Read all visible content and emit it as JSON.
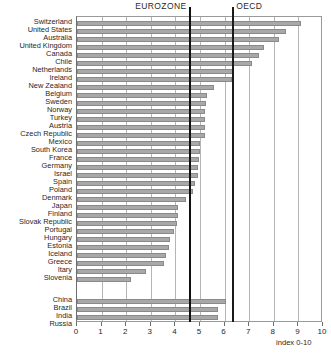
{
  "chart_data": {
    "type": "bar",
    "orientation": "horizontal",
    "title": "",
    "xlabel": "index 0-10",
    "ylabel": "",
    "xlim": [
      0,
      10
    ],
    "xticks": [
      0,
      1,
      2,
      3,
      4,
      5,
      6,
      7,
      8,
      9,
      10
    ],
    "grid": true,
    "legend_position": "none",
    "reference_lines": [
      {
        "label": "EUROZONE",
        "value": 4.6
      },
      {
        "label": "OECD",
        "value": 6.35
      }
    ],
    "groups": [
      {
        "name": "OECD countries",
        "categories": [
          "Switzerland",
          "United States",
          "Australia",
          "United Kingdom",
          "Canada",
          "Chile",
          "Netherlands",
          "Ireland",
          "New Zealand",
          "Belgium",
          "Sweden",
          "Norway",
          "Turkey",
          "Austria",
          "Czech Republic",
          "Mexico",
          "South Korea",
          "France",
          "Germany",
          "Israel",
          "Spain",
          "Poland",
          "Denmark",
          "Japan",
          "Finland",
          "Slovak Republic",
          "Portugal",
          "Hungary",
          "Estonia",
          "Iceland",
          "Greece",
          "Itary",
          "Slovenia"
        ],
        "values": [
          9.1,
          8.5,
          8.2,
          7.6,
          7.4,
          7.1,
          6.35,
          6.3,
          5.55,
          5.3,
          5.25,
          5.2,
          5.2,
          5.2,
          5.2,
          5.0,
          5.0,
          4.95,
          4.9,
          4.9,
          4.8,
          4.7,
          4.45,
          4.1,
          4.1,
          4.05,
          3.95,
          3.8,
          3.75,
          3.6,
          3.55,
          2.8,
          2.2
        ]
      },
      {
        "name": "Non-member economies",
        "categories": [
          "China",
          "Brazil",
          "India",
          "Russia"
        ],
        "values": [
          6.05,
          5.75,
          5.75,
          5.4
        ]
      }
    ],
    "colors": {
      "bar_fill": "#a8a8a8",
      "bar_stroke": "#8a8a8a",
      "gridline": "#b5b5b5",
      "reference_line": "#111111",
      "axis": "#6d6d6d",
      "text": "#1f1f1f",
      "background": "#ffffff"
    }
  }
}
